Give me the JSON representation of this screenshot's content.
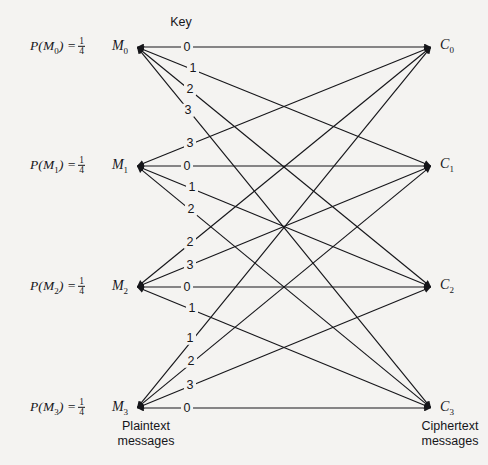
{
  "figure": {
    "key_title": "Key",
    "plaintext_caption_line1": "Plaintext",
    "plaintext_caption_line2": "messages",
    "ciphertext_caption_line1": "Ciphertext",
    "ciphertext_caption_line2": "messages",
    "line_color": "#16161a",
    "background_color": "#f4f3f1"
  },
  "probabilities": [
    {
      "id": "p-m0",
      "prefix": "P(M",
      "sub": "0",
      "suffix": ") =",
      "numerator": "1",
      "denominator": "4",
      "x": 30,
      "y": 47
    },
    {
      "id": "p-m1",
      "prefix": "P(M",
      "sub": "1",
      "suffix": ") =",
      "numerator": "1",
      "denominator": "4",
      "x": 30,
      "y": 166
    },
    {
      "id": "p-m2",
      "prefix": "P(M",
      "sub": "2",
      "suffix": ") =",
      "numerator": "1",
      "denominator": "4",
      "x": 30,
      "y": 287
    },
    {
      "id": "p-m3",
      "prefix": "P(M",
      "sub": "3",
      "suffix": ") =",
      "numerator": "1",
      "denominator": "4",
      "x": 30,
      "y": 408
    }
  ],
  "plaintext_nodes": [
    {
      "id": "M0",
      "base": "M",
      "sub": "0",
      "label_x": 120,
      "label_y": 47,
      "node_x": 137,
      "node_y": 47
    },
    {
      "id": "M1",
      "base": "M",
      "sub": "1",
      "label_x": 120,
      "label_y": 166,
      "node_x": 137,
      "node_y": 166
    },
    {
      "id": "M2",
      "base": "M",
      "sub": "2",
      "label_x": 120,
      "label_y": 287,
      "node_x": 137,
      "node_y": 287
    },
    {
      "id": "M3",
      "base": "M",
      "sub": "3",
      "label_x": 120,
      "label_y": 408,
      "node_x": 137,
      "node_y": 408
    }
  ],
  "ciphertext_nodes": [
    {
      "id": "C0",
      "base": "C",
      "sub": "0",
      "label_x": 447,
      "label_y": 46,
      "node_x": 431,
      "node_y": 47
    },
    {
      "id": "C1",
      "base": "C",
      "sub": "1",
      "label_x": 447,
      "label_y": 165,
      "node_x": 431,
      "node_y": 166
    },
    {
      "id": "C2",
      "base": "C",
      "sub": "2",
      "label_x": 447,
      "label_y": 286,
      "node_x": 431,
      "node_y": 287
    },
    {
      "id": "C3",
      "base": "C",
      "sub": "3",
      "label_x": 447,
      "label_y": 408,
      "node_x": 431,
      "node_y": 408
    }
  ],
  "edges": [
    {
      "from": "M0",
      "to": "C0",
      "key": "0",
      "label_x": 187,
      "label_y": 47
    },
    {
      "from": "M0",
      "to": "C1",
      "key": "1",
      "label_x": 193,
      "label_y": 68
    },
    {
      "from": "M0",
      "to": "C2",
      "key": "2",
      "label_x": 190,
      "label_y": 89
    },
    {
      "from": "M0",
      "to": "C3",
      "key": "3",
      "label_x": 188,
      "label_y": 110
    },
    {
      "from": "M1",
      "to": "C0",
      "key": "3",
      "label_x": 190,
      "label_y": 143
    },
    {
      "from": "M1",
      "to": "C1",
      "key": "0",
      "label_x": 187,
      "label_y": 166
    },
    {
      "from": "M1",
      "to": "C2",
      "key": "1",
      "label_x": 192,
      "label_y": 187
    },
    {
      "from": "M1",
      "to": "C3",
      "key": "2",
      "label_x": 191,
      "label_y": 209
    },
    {
      "from": "M2",
      "to": "C0",
      "key": "2",
      "label_x": 190,
      "label_y": 242
    },
    {
      "from": "M2",
      "to": "C1",
      "key": "3",
      "label_x": 190,
      "label_y": 265
    },
    {
      "from": "M2",
      "to": "C2",
      "key": "0",
      "label_x": 187,
      "label_y": 287
    },
    {
      "from": "M2",
      "to": "C3",
      "key": "1",
      "label_x": 192,
      "label_y": 308
    },
    {
      "from": "M3",
      "to": "C0",
      "key": "1",
      "label_x": 190,
      "label_y": 338
    },
    {
      "from": "M3",
      "to": "C1",
      "key": "2",
      "label_x": 191,
      "label_y": 361
    },
    {
      "from": "M3",
      "to": "C2",
      "key": "3",
      "label_x": 190,
      "label_y": 385
    },
    {
      "from": "M3",
      "to": "C3",
      "key": "0",
      "label_x": 187,
      "label_y": 408
    }
  ],
  "captions": [
    {
      "id": "plaintext",
      "line1": "Plaintext",
      "line2": "messages",
      "x": 146,
      "y": 419
    },
    {
      "id": "ciphertext",
      "line1": "Ciphertext",
      "line2": "messages",
      "x": 450,
      "y": 419
    }
  ],
  "key_title_pos": {
    "x": 181,
    "y": 22
  }
}
